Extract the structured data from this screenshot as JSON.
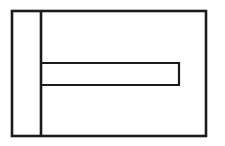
{
  "figure": {
    "type": "technical-line-drawing",
    "canvas": {
      "width": 225,
      "height": 146,
      "background": "#fdfdfd"
    },
    "stroke": {
      "color": "#1b1b1b",
      "outer_width": 2.6,
      "inner_width": 2.2
    },
    "fill": "#ffffff",
    "shapes": {
      "outer_rectangle": {
        "name": "outer-rectangle",
        "x": 12,
        "y": 11,
        "width": 194,
        "height": 125,
        "right": 206,
        "bottom": 136
      },
      "vertical_divider": {
        "name": "vertical-divider-line",
        "x": 41,
        "y_start": 11,
        "y_end": 136
      },
      "slot_rectangle": {
        "name": "horizontal-slot",
        "x": 41,
        "y": 63,
        "width": 138,
        "height": 22,
        "right": 179,
        "bottom": 85,
        "open_side": "left"
      }
    },
    "regions": [
      {
        "name": "left-column",
        "label": ""
      },
      {
        "name": "upper-right-region",
        "label": ""
      },
      {
        "name": "slot-interior",
        "label": ""
      },
      {
        "name": "lower-right-region",
        "label": ""
      }
    ]
  }
}
